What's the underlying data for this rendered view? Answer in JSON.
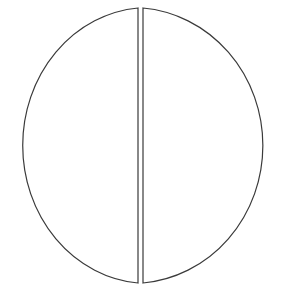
{
  "diagram": {
    "type": "split-circle",
    "stroke_color": "#3a3a3a",
    "background": "#ffffff",
    "halves": [
      {
        "name": "left-half"
      },
      {
        "name": "right-half"
      }
    ]
  }
}
